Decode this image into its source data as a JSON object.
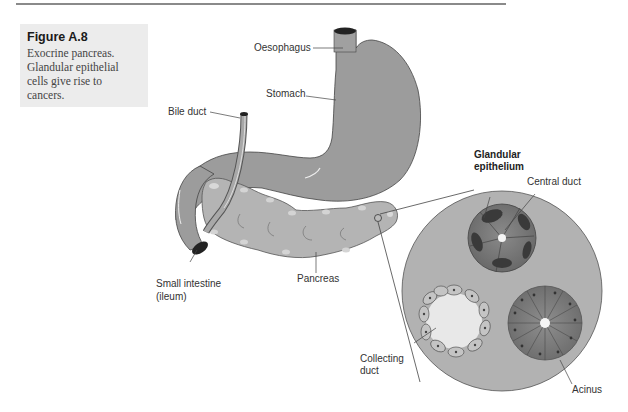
{
  "figure": {
    "number": "Figure A.8",
    "caption": "Exocrine pancreas. Glandular epithelial cells give rise to cancers.",
    "caption_lines": [
      "Exocrine pancreas.",
      "Glandular epithelial",
      "cells give rise to",
      "cancers."
    ]
  },
  "labels": {
    "oesophagus": "Oesophagus",
    "stomach": "Stomach",
    "bile_duct": "Bile duct",
    "small_intestine_line1": "Small intestine",
    "small_intestine_line2": "(ileum)",
    "pancreas": "Pancreas",
    "glandular_line1": "Glandular",
    "glandular_line2": "epithelium",
    "central_duct": "Central duct",
    "collecting_line1": "Collecting",
    "collecting_line2": "duct",
    "acinus": "Acinus"
  },
  "colors": {
    "organ_gray": "#9a9a9a",
    "pancreas_gray": "#b4b4b4",
    "inset_bg": "#b0b0b0",
    "caption_bg": "#ececec",
    "cell_dark": "#7a7a7a"
  }
}
